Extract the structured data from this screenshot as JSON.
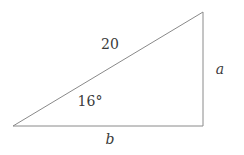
{
  "figure": {
    "type": "right-triangle-diagram",
    "background_color": "#ffffff",
    "stroke_color": "#8a8a8a",
    "text_color": "#3a3a3a",
    "stroke_width": 1,
    "vertices": {
      "left": {
        "x": 13,
        "y": 126
      },
      "bottom_right": {
        "x": 203,
        "y": 126
      },
      "top_right": {
        "x": 203,
        "y": 12
      }
    },
    "labels": {
      "hypotenuse": "20",
      "angle": "16°",
      "side_vertical": "a",
      "side_horizontal": "b"
    }
  },
  "chart_data": {
    "type": "diagram",
    "title": "",
    "shape": "right triangle",
    "known_values": {
      "hypotenuse": 20,
      "angle_degrees": 16
    },
    "unknown_values": {
      "opposite_side": "a",
      "adjacent_side": "b"
    },
    "annotations": [
      "20",
      "16°",
      "a",
      "b"
    ]
  }
}
